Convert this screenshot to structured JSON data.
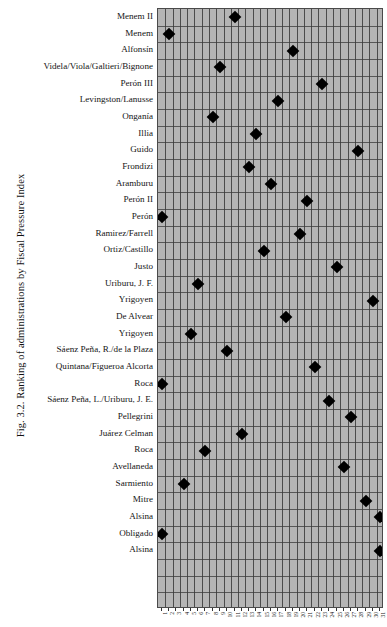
{
  "figure": {
    "caption": "Fig. 3.2.  Ranking of administrations by Fiscal Pressure Index"
  },
  "chart_data": {
    "type": "scatter",
    "title": "Fig. 3.2. Ranking of administrations by Fiscal Pressure Index",
    "xlabel": "",
    "ylabel": "",
    "grid": true,
    "legend": false,
    "marker": "diamond",
    "marker_color": "#000000",
    "panel_color": "#b5b5b5",
    "xlim": [
      0,
      31
    ],
    "x_tick_labels": [
      "1",
      "2",
      "3",
      "4",
      "5",
      "6",
      "7",
      "8",
      "9",
      "10",
      "11",
      "12",
      "13",
      "14",
      "15",
      "16",
      "17",
      "18",
      "19",
      "20",
      "21",
      "22",
      "23",
      "24",
      "25",
      "26",
      "27",
      "28",
      "29",
      "30",
      "31"
    ],
    "categories": [
      "Menem II",
      "Menem",
      "Alfonsín",
      "Videla/Viola/Galtieri/Bignone",
      "Perón III",
      "Levingston/Lanusse",
      "Onganía",
      "Illia",
      "Guido",
      "Frondizi",
      "Aramburu",
      "Perón II",
      "Perón",
      "Ramirez/Farrell",
      "Ortiz/Castillo",
      "Justo",
      "Uriburu, J. F.",
      "Yrigoyen",
      "De Alvear",
      "Yrigoyen",
      "Sáenz Peña, R./de la Plaza",
      "Quintana/Figueroa Alcorta",
      "Roca",
      "Sáenz Peña, L./Uriburu, J. E.",
      "Pellegrini",
      "Juárez Celman",
      "Roca",
      "Avellaneda",
      "Sarmiento",
      "Mitre",
      "Alsina",
      "Obligado",
      "Alsina"
    ],
    "values": [
      11,
      2,
      19,
      9,
      23,
      17,
      8,
      14,
      28,
      13,
      16,
      21,
      1,
      20,
      15,
      25,
      6,
      30,
      18,
      5,
      10,
      22,
      1,
      24,
      27,
      12,
      7,
      26,
      4,
      29,
      31,
      1,
      31
    ],
    "points": [
      {
        "label": "Menem II",
        "row": 1,
        "x": 11
      },
      {
        "label": "Menem",
        "row": 2,
        "x": 2
      },
      {
        "label": "Alfonsín",
        "row": 3,
        "x": 19
      },
      {
        "label": "Videla/Viola/Galtieri/Bignone",
        "row": 4,
        "x": 9
      },
      {
        "label": "Perón III",
        "row": 5,
        "x": 23
      },
      {
        "label": "Levingston/Lanusse",
        "row": 6,
        "x": 17
      },
      {
        "label": "Onganía",
        "row": 7,
        "x": 8
      },
      {
        "label": "Illia",
        "row": 8,
        "x": 14
      },
      {
        "label": "Guido",
        "row": 9,
        "x": 28
      },
      {
        "label": "Frondizi",
        "row": 10,
        "x": 13
      },
      {
        "label": "Aramburu",
        "row": 11,
        "x": 16
      },
      {
        "label": "Perón II",
        "row": 12,
        "x": 21
      },
      {
        "label": "Perón",
        "row": 13,
        "x": 1
      },
      {
        "label": "Ramirez/Farrell",
        "row": 14,
        "x": 20
      },
      {
        "label": "Ortiz/Castillo",
        "row": 15,
        "x": 15
      },
      {
        "label": "Justo",
        "row": 16,
        "x": 25
      },
      {
        "label": "Uriburu, J. F.",
        "row": 17,
        "x": 6
      },
      {
        "label": "Yrigoyen",
        "row": 18,
        "x": 30
      },
      {
        "label": "De Alvear",
        "row": 19,
        "x": 18
      },
      {
        "label": "Yrigoyen",
        "row": 20,
        "x": 5
      },
      {
        "label": "Sáenz Peña, R./de la Plaza",
        "row": 21,
        "x": 10
      },
      {
        "label": "Quintana/Figueroa Alcorta",
        "row": 22,
        "x": 22
      },
      {
        "label": "Roca",
        "row": 23,
        "x": 1
      },
      {
        "label": "Sáenz Peña, L./Uriburu, J. E.",
        "row": 24,
        "x": 24
      },
      {
        "label": "Pellegrini",
        "row": 25,
        "x": 27
      },
      {
        "label": "Juárez Celman",
        "row": 26,
        "x": 12
      },
      {
        "label": "Roca",
        "row": 27,
        "x": 7
      },
      {
        "label": "Avellaneda",
        "row": 28,
        "x": 26
      },
      {
        "label": "Sarmiento",
        "row": 29,
        "x": 4
      },
      {
        "label": "Mitre",
        "row": 30,
        "x": 29
      },
      {
        "label": "Alsina",
        "row": 31,
        "x": 31
      },
      {
        "label": "Obligado",
        "row": 32,
        "x": 1
      },
      {
        "label": "Alsina",
        "row": 33,
        "x": 31
      }
    ]
  }
}
